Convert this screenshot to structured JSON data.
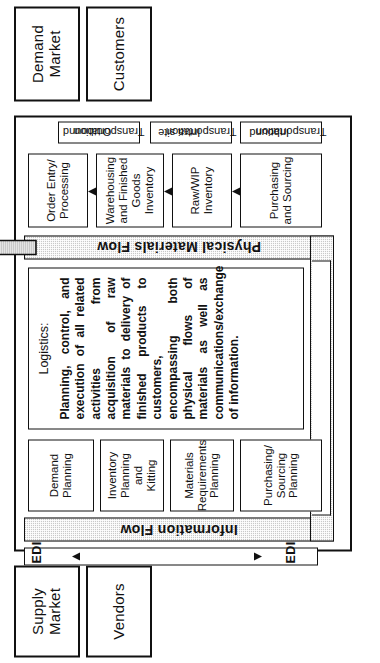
{
  "diagram": {
    "orientation": "rotated-90",
    "colors": {
      "ink": "#111111",
      "band_fill": "#c9c9c9",
      "paper": "#ffffff"
    }
  },
  "endcaps": {
    "supply": {
      "line1": "Supply",
      "line2": "Market"
    },
    "demand": {
      "line1": "Demand",
      "line2": "Market"
    },
    "vendors": {
      "label": "Vendors"
    },
    "customers": {
      "label": "Customers"
    }
  },
  "planning_row": {
    "row_name": "Planning",
    "boxes": [
      {
        "line1": "Purchasing/",
        "line2": "Sourcing",
        "line3": "Planning"
      },
      {
        "line1": "Materials",
        "line2": "Requirements",
        "line3": "Planning"
      },
      {
        "line1": "Inventory",
        "line2": "Planning and",
        "line3": "Kitting"
      },
      {
        "line1": "Demand",
        "line2": "Planning",
        "line3": ""
      }
    ]
  },
  "execution_row": {
    "row_name": "Execution",
    "boxes": [
      {
        "line1": "Purchasing",
        "line2": "and Sourcing",
        "line3": ""
      },
      {
        "line1": "Raw/WIP",
        "line2": "Inventory",
        "line3": ""
      },
      {
        "line1": "Warehousing",
        "line2": "and Finished",
        "line3": "Goods",
        "line4": "Inventory"
      },
      {
        "line1": "Order Entry/",
        "line2": "Processing",
        "line3": ""
      }
    ]
  },
  "transportation_row": {
    "row_name": "Transportation",
    "boxes": [
      {
        "line1": "Inbound",
        "line2": "Transportation"
      },
      {
        "line1": "Intra site",
        "line2": "Transportation"
      },
      {
        "line1": "Outbound",
        "line2": "Transportation"
      }
    ]
  },
  "flows": {
    "information": {
      "label": "Information Flow"
    },
    "materials": {
      "label": "Physical Materials Flow"
    },
    "edi_left": {
      "label": "EDI"
    },
    "edi_right": {
      "label": "EDI"
    }
  },
  "logistics": {
    "title": "Logistics:",
    "body": "Planning, control, and execution of all related activities from acquisition of raw materials to delivery of finished products to customers, encompassing both physical flows of materials as well as communications/exchange of information."
  }
}
